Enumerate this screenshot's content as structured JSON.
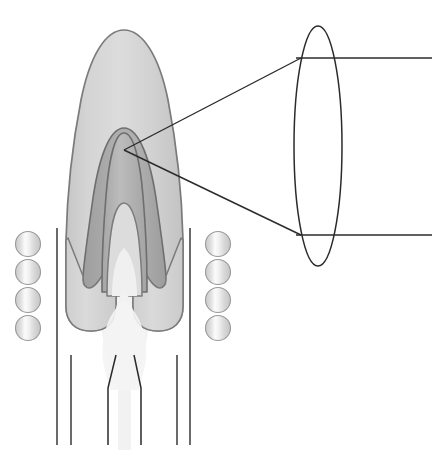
{
  "figure": {
    "title": "",
    "background_color": "#ffffff",
    "width": 434,
    "height": 450
  },
  "palette": {
    "stroke_dark": "#2b2b2b",
    "stroke_shape": "#808080",
    "outer_flame_light": "#d6d6d6",
    "outer_flame_mid": "#c9c9c9",
    "mid_flame_gray": "#a9a9a9",
    "inner_flame_gray": "#b8b8b8",
    "core_plume_light": "#f0f0f0",
    "sphere_fill": "#e3e3e3",
    "sphere_highlight": "#fbfbfb",
    "sphere_stroke": "#9a9a9a"
  },
  "diagram": {
    "name": "flame-structure-with-magnified-inset",
    "outer_flame": {
      "name": "outer-flame-envelope",
      "fill": "#d2d2d2",
      "stroke": "#7d7d7d",
      "stroke_width": 1.6
    },
    "mid_flame": {
      "name": "inner-cone-dark-region",
      "fill": "#a9a9a9",
      "stroke": "#6f6f6f",
      "stroke_width": 1.6
    },
    "inner_cone": {
      "name": "inner-reaction-cone",
      "fill": "#b5b5b5",
      "stroke": "#6f6f6f",
      "stroke_width": 1.6
    },
    "core_plume": {
      "name": "central-gas-plume",
      "fill": "#f2f2f2",
      "stroke": "none"
    },
    "lobes": {
      "name": "flame-lobes",
      "count": 2,
      "fill": "#d8d8d8",
      "stroke": "#7d7d7d"
    }
  },
  "magnifier": {
    "name": "magnified-inset-ellipse",
    "ellipse": {
      "center_x": 318,
      "center_y": 146,
      "radius_x": 24,
      "radius_y": 120,
      "stroke": "#2b2b2b",
      "stroke_width": 1.5,
      "fill": "none"
    },
    "callout_vertex": {
      "x": 124,
      "y": 150
    },
    "upper_line": {
      "x1": 124,
      "y1": 150,
      "x2": 301,
      "y2": 58
    },
    "lower_line": {
      "x1": 124,
      "y1": 150,
      "x2": 301,
      "y2": 235
    },
    "upper_rule": {
      "x1": 296,
      "y1": 58,
      "x2": 432,
      "y2": 58
    },
    "lower_rule": {
      "x1": 296,
      "y1": 235,
      "x2": 432,
      "y2": 235
    }
  },
  "burner": {
    "name": "burner-walls",
    "outer_wall_left": {
      "x": 57,
      "y1": 228,
      "y2": 445
    },
    "outer_wall_right": {
      "x": 190,
      "y1": 228,
      "y2": 445
    },
    "inner_wall_left": {
      "x": 71,
      "y1": 355,
      "y2": 445
    },
    "inner_wall_right": {
      "x": 177,
      "y1": 355,
      "y2": 445
    },
    "stroke": "#2b2b2b",
    "stroke_width": 1.4
  },
  "nozzle": {
    "name": "nozzle-throat-outline",
    "left_path": "M 116 355 L 108 388 L 108 445",
    "right_path": "M 134 355 L 141 388 L 141 445",
    "stroke": "#2b2b2b",
    "stroke_width": 1.5
  },
  "spheres": {
    "name": "particle-spheres",
    "diameter": 25,
    "left_column": {
      "label": "left-sphere-column",
      "x": 28,
      "items": [
        {
          "name": "sphere-left-1",
          "cy": 244
        },
        {
          "name": "sphere-left-2",
          "cy": 272
        },
        {
          "name": "sphere-left-3",
          "cy": 300
        },
        {
          "name": "sphere-left-4",
          "cy": 328
        }
      ]
    },
    "right_column": {
      "label": "right-sphere-column",
      "x": 218,
      "items": [
        {
          "name": "sphere-right-1",
          "cy": 244
        },
        {
          "name": "sphere-right-2",
          "cy": 272
        },
        {
          "name": "sphere-right-3",
          "cy": 300
        },
        {
          "name": "sphere-right-4",
          "cy": 328
        }
      ]
    }
  }
}
